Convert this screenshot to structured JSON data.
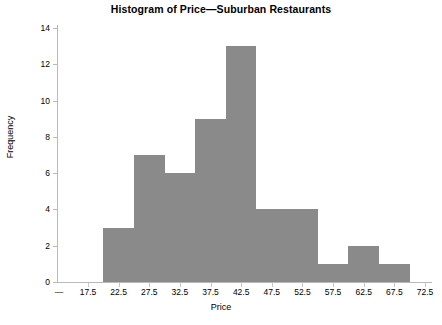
{
  "chart_data": {
    "type": "bar",
    "title": "Histogram of Price—Suburban Restaurants",
    "xlabel": "Price",
    "ylabel": "Frequency",
    "bin_width": 5,
    "bin_starts": [
      20,
      25,
      30,
      35,
      40,
      45,
      50,
      55,
      60,
      65
    ],
    "categories": [
      "20-25",
      "25-30",
      "30-35",
      "35-40",
      "40-45",
      "45-50",
      "50-55",
      "55-60",
      "60-65",
      "65-70"
    ],
    "values": [
      3,
      7,
      6,
      9,
      13,
      4,
      4,
      1,
      2,
      1
    ],
    "xlim": [
      15,
      72.5
    ],
    "ylim": [
      0,
      14
    ],
    "xticks": [
      "17.5",
      "22.5",
      "27.5",
      "32.5",
      "37.5",
      "42.5",
      "47.5",
      "52.5",
      "57.5",
      "62.5",
      "67.5",
      "72.5"
    ],
    "xtick_values": [
      17.5,
      22.5,
      27.5,
      32.5,
      37.5,
      42.5,
      47.5,
      52.5,
      57.5,
      62.5,
      67.5,
      72.5
    ],
    "yticks": [
      "0",
      "2",
      "4",
      "6",
      "8",
      "10",
      "12",
      "14"
    ],
    "ytick_values": [
      0,
      2,
      4,
      6,
      8,
      10,
      12,
      14
    ],
    "axis_break_symbol": "—",
    "grid": false,
    "legend": null,
    "bar_color": "#8a8a8a",
    "axis_color": "#b9b9b9",
    "background_color": "#ffffff"
  }
}
